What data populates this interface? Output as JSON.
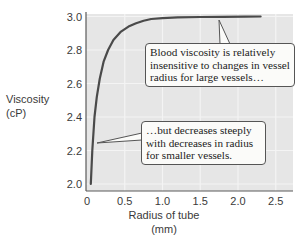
{
  "chart_data": {
    "type": "line",
    "title": "",
    "xlabel": "Radius of tube (mm)",
    "xlabel_lines": [
      "Radius of tube",
      "(mm)"
    ],
    "ylabel": "Viscosity (cP)",
    "ylabel_lines": [
      "Viscosity",
      "(cP)"
    ],
    "xlim": [
      0,
      2.7
    ],
    "ylim": [
      1.95,
      3.05
    ],
    "x_ticks": [
      0,
      0.5,
      1.0,
      1.5,
      2.0,
      2.5
    ],
    "x_tick_labels": [
      "0",
      "0.5",
      "1.0",
      "1.5",
      "2.0",
      "2.5"
    ],
    "y_ticks": [
      2.0,
      2.2,
      2.4,
      2.6,
      2.8,
      3.0
    ],
    "y_tick_labels": [
      "2.0",
      "2.2",
      "2.4",
      "2.6",
      "2.8",
      "3.0"
    ],
    "grid": true,
    "series": [
      {
        "name": "Blood viscosity",
        "x": [
          0.05,
          0.07,
          0.1,
          0.13,
          0.17,
          0.22,
          0.28,
          0.35,
          0.45,
          0.55,
          0.65,
          0.75,
          0.85,
          1.0,
          1.2,
          1.5,
          1.8,
          2.1,
          2.3
        ],
        "values": [
          2.0,
          2.2,
          2.4,
          2.52,
          2.63,
          2.73,
          2.8,
          2.86,
          2.91,
          2.94,
          2.96,
          2.975,
          2.985,
          2.99,
          2.995,
          2.997,
          2.998,
          2.999,
          3.0
        ]
      }
    ],
    "annotations": [
      {
        "text_lines": [
          "Blood viscosity is relatively",
          "insensitive to changes in vessel",
          "radius for large vessels…"
        ],
        "points_to": [
          1.8,
          3.0
        ]
      },
      {
        "text_lines": [
          "…but decreases steeply",
          "with decreases in radius",
          "for smaller vessels."
        ],
        "points_to": [
          0.1,
          2.23
        ]
      }
    ],
    "legend": null
  },
  "colors": {
    "plot_background": "#e6e6e6",
    "grid": "#f4f4f4",
    "curve": "#4a4a4a",
    "axis": "#5a5a5a",
    "text": "#3a3a3a"
  }
}
